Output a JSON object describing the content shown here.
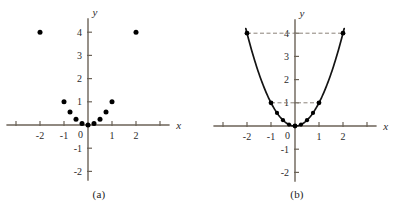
{
  "figure": {
    "background_color": "#ffffff",
    "axis_color": "#6b6257",
    "point_color": "#000000",
    "curve_color": "#141414",
    "dash_color": "#8a8279"
  },
  "panels": [
    {
      "id": "a",
      "caption": "(a)",
      "axis_labels": {
        "x": "x",
        "y": "y"
      },
      "x_ticks": [
        {
          "value": -3,
          "label": ""
        },
        {
          "value": -2,
          "label": "-2"
        },
        {
          "value": -1,
          "label": "-1"
        },
        {
          "value": 1,
          "label": "1"
        },
        {
          "value": 2,
          "label": "2"
        },
        {
          "value": 3,
          "label": ""
        }
      ],
      "y_ticks": [
        {
          "value": 4,
          "label": "4"
        },
        {
          "value": 3,
          "label": "3"
        },
        {
          "value": 2,
          "label": "2"
        },
        {
          "value": 1,
          "label": "1"
        },
        {
          "value": -1,
          "label": "-1"
        },
        {
          "value": -2,
          "label": "-2"
        }
      ],
      "origin_label": "0"
    },
    {
      "id": "b",
      "caption": "(b)",
      "axis_labels": {
        "x": "x",
        "y": "y"
      },
      "x_ticks": [
        {
          "value": -3,
          "label": ""
        },
        {
          "value": -2,
          "label": "-2"
        },
        {
          "value": -1,
          "label": "-1"
        },
        {
          "value": 1,
          "label": "1"
        },
        {
          "value": 2,
          "label": "2"
        },
        {
          "value": 3,
          "label": ""
        }
      ],
      "y_ticks": [
        {
          "value": 4,
          "label": "4"
        },
        {
          "value": 3,
          "label": "3"
        },
        {
          "value": 2,
          "label": "2"
        },
        {
          "value": 1,
          "label": "1"
        },
        {
          "value": -1,
          "label": "-1"
        },
        {
          "value": -2,
          "label": "-2"
        }
      ],
      "origin_label": "0"
    }
  ],
  "chart_data": [
    {
      "type": "scatter",
      "panel": "a",
      "title": "(a)",
      "xlabel": "x",
      "ylabel": "y",
      "xlim": [
        -3.4,
        3.4
      ],
      "ylim": [
        -2.4,
        4.6
      ],
      "grid": false,
      "legend": "none",
      "xticks": [
        -2,
        -1,
        0,
        1,
        2
      ],
      "yticks": [
        -2,
        -1,
        0,
        1,
        2,
        3,
        4
      ],
      "series": [
        {
          "name": "y = x^2 sample points",
          "points": [
            {
              "x": -2,
              "y": 4
            },
            {
              "x": -1,
              "y": 1
            },
            {
              "x": -0.75,
              "y": 0.5625
            },
            {
              "x": -0.5,
              "y": 0.25
            },
            {
              "x": -0.25,
              "y": 0.0625
            },
            {
              "x": 0,
              "y": 0
            },
            {
              "x": 0.25,
              "y": 0.0625
            },
            {
              "x": 0.5,
              "y": 0.25
            },
            {
              "x": 0.75,
              "y": 0.5625
            },
            {
              "x": 1,
              "y": 1
            },
            {
              "x": 2,
              "y": 4
            }
          ]
        }
      ]
    },
    {
      "type": "line",
      "panel": "b",
      "title": "(b)",
      "xlabel": "x",
      "ylabel": "y",
      "xlim": [
        -3.4,
        3.4
      ],
      "ylim": [
        -2.4,
        4.6
      ],
      "grid": false,
      "legend": "none",
      "xticks": [
        -2,
        -1,
        0,
        1,
        2
      ],
      "yticks": [
        -2,
        -1,
        0,
        1,
        2,
        3,
        4
      ],
      "curve": {
        "name": "y = x^2",
        "equation": "y = x^2",
        "x_range": [
          -2.05,
          2.05
        ]
      },
      "series": [
        {
          "name": "y = x^2 sample points",
          "points": [
            {
              "x": -2,
              "y": 4
            },
            {
              "x": -1,
              "y": 1
            },
            {
              "x": -0.75,
              "y": 0.5625
            },
            {
              "x": -0.5,
              "y": 0.25
            },
            {
              "x": -0.25,
              "y": 0.0625
            },
            {
              "x": 0,
              "y": 0
            },
            {
              "x": 0.25,
              "y": 0.0625
            },
            {
              "x": 0.5,
              "y": 0.25
            },
            {
              "x": 0.75,
              "y": 0.5625
            },
            {
              "x": 1,
              "y": 1
            },
            {
              "x": 2,
              "y": 4
            }
          ]
        }
      ],
      "annotations": [
        {
          "type": "dashed-hline",
          "y": 4,
          "x_from": -2,
          "x_to": 2,
          "label": "4"
        },
        {
          "type": "dashed-hline",
          "y": 1,
          "x_from": -1,
          "x_to": 1,
          "label": "1"
        }
      ]
    }
  ]
}
